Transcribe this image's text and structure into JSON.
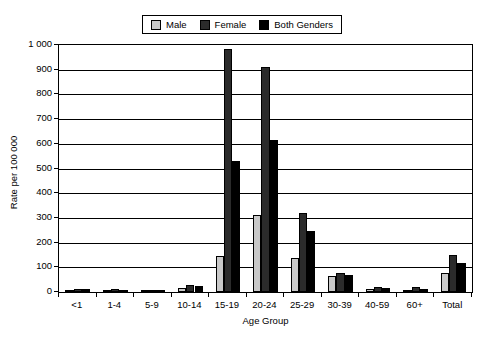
{
  "chart_data": {
    "type": "bar",
    "title": "",
    "xlabel": "Age Group",
    "ylabel": "Rate per 100 000",
    "ylim": [
      0,
      1000
    ],
    "ytick_step": 100,
    "ytick_labels": [
      "1 000",
      "900",
      "800",
      "700",
      "600",
      "500",
      "400",
      "300",
      "200",
      "100",
      "0"
    ],
    "ytick_values": [
      1000,
      900,
      800,
      700,
      600,
      500,
      400,
      300,
      200,
      100,
      0
    ],
    "grid": true,
    "grid_axis": "y",
    "legend_position": "top-center",
    "categories": [
      "<1",
      "1-4",
      "5-9",
      "10-14",
      "15-19",
      "20-24",
      "25-29",
      "30-39",
      "40-59",
      "60+",
      "Total"
    ],
    "series": [
      {
        "name": "Male",
        "color": "#c9c9c9",
        "values": [
          9,
          8,
          5,
          18,
          145,
          311,
          139,
          64,
          14,
          10,
          76
        ]
      },
      {
        "name": "Female",
        "color": "#2b2b2b",
        "values": [
          13,
          13,
          8,
          30,
          985,
          911,
          318,
          76,
          22,
          19,
          150
        ]
      },
      {
        "name": "Both Genders",
        "color": "#000000",
        "values": [
          11,
          10,
          6,
          24,
          531,
          614,
          246,
          70,
          18,
          14,
          117
        ]
      }
    ]
  },
  "legend": {
    "entries": [
      {
        "label": "Male"
      },
      {
        "label": "Female"
      },
      {
        "label": "Both Genders"
      }
    ]
  }
}
